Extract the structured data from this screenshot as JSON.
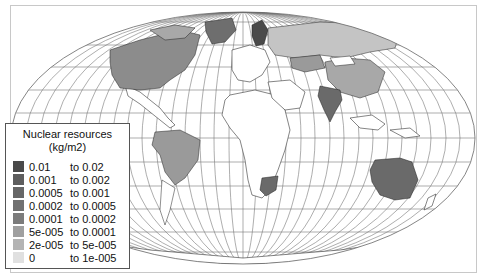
{
  "legend": {
    "title_line1": "Nuclear resources",
    "title_line2": "(kg/m2)",
    "items": [
      {
        "low": "0.01",
        "high": "to 0.02",
        "color": "#4a4a4a"
      },
      {
        "low": "0.001",
        "high": "to 0.002",
        "color": "#5e5e5e"
      },
      {
        "low": "0.0005",
        "high": "to 0.001",
        "color": "#676767"
      },
      {
        "low": "0.0002",
        "high": "to 0.0005",
        "color": "#717171"
      },
      {
        "low": "0.0001",
        "high": "to 0.0002",
        "color": "#7c7c7c"
      },
      {
        "low": "5e-005",
        "high": "to 0.0001",
        "color": "#a0a0a0"
      },
      {
        "low": "2e-005",
        "high": "to 5e-005",
        "color": "#b4b4b4"
      },
      {
        "low": "0",
        "high": "to 1e-005",
        "color": "#e0e0e0"
      }
    ]
  },
  "map": {
    "projection": "Mollweide-like world map",
    "shaded_regions": [
      {
        "name": "North America (USA/Canada)",
        "color": "#8c8c8c"
      },
      {
        "name": "Greenland",
        "color": "#6e6e6e"
      },
      {
        "name": "Scandinavia",
        "color": "#4a4a4a"
      },
      {
        "name": "Russia",
        "color": "#c4c4c4"
      },
      {
        "name": "Kazakhstan",
        "color": "#9a9a9a"
      },
      {
        "name": "China",
        "color": "#a8a8a8"
      },
      {
        "name": "India",
        "color": "#6a6a6a"
      },
      {
        "name": "Brazil",
        "color": "#9a9a9a"
      },
      {
        "name": "South Africa",
        "color": "#6a6a6a"
      },
      {
        "name": "Australia",
        "color": "#6a6a6a"
      }
    ]
  }
}
